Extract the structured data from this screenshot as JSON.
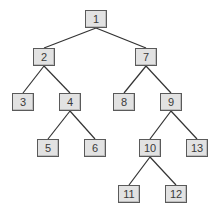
{
  "diagram": {
    "type": "tree",
    "style": {
      "node_fill": "#e2e2e2",
      "node_border": "#5a5a5a",
      "edge_color": "#333333",
      "text_color": "#3a3a3a"
    },
    "nodes": [
      {
        "id": "1",
        "label": "1",
        "x": 85,
        "y": 10
      },
      {
        "id": "2",
        "label": "2",
        "x": 33,
        "y": 48
      },
      {
        "id": "7",
        "label": "7",
        "x": 135,
        "y": 48
      },
      {
        "id": "3",
        "label": "3",
        "x": 12,
        "y": 93
      },
      {
        "id": "4",
        "label": "4",
        "x": 59,
        "y": 93
      },
      {
        "id": "8",
        "label": "8",
        "x": 113,
        "y": 93
      },
      {
        "id": "9",
        "label": "9",
        "x": 160,
        "y": 93
      },
      {
        "id": "5",
        "label": "5",
        "x": 37,
        "y": 139
      },
      {
        "id": "6",
        "label": "6",
        "x": 84,
        "y": 139
      },
      {
        "id": "10",
        "label": "10",
        "x": 139,
        "y": 139
      },
      {
        "id": "13",
        "label": "13",
        "x": 186,
        "y": 139
      },
      {
        "id": "11",
        "label": "11",
        "x": 118,
        "y": 185
      },
      {
        "id": "12",
        "label": "12",
        "x": 165,
        "y": 185
      }
    ],
    "edges": [
      [
        "1",
        "2"
      ],
      [
        "1",
        "7"
      ],
      [
        "2",
        "3"
      ],
      [
        "2",
        "4"
      ],
      [
        "7",
        "8"
      ],
      [
        "7",
        "9"
      ],
      [
        "4",
        "5"
      ],
      [
        "4",
        "6"
      ],
      [
        "9",
        "10"
      ],
      [
        "9",
        "13"
      ],
      [
        "10",
        "11"
      ],
      [
        "10",
        "12"
      ]
    ]
  }
}
